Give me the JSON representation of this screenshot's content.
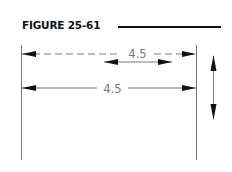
{
  "figure": {
    "title": "FIGURE 25-61",
    "dimensions": [
      {
        "id": "dashed-dimension",
        "label": "4.5",
        "style": "dashed"
      },
      {
        "id": "solid-dimension",
        "label": "4.5",
        "style": "solid"
      }
    ],
    "arrows": [
      {
        "id": "short-horizontal-double-arrow",
        "direction": "horizontal"
      },
      {
        "id": "vertical-double-arrow",
        "direction": "vertical"
      }
    ],
    "colors": {
      "line": "#555555",
      "arrowhead": "#111111",
      "text": "#777777",
      "title": "#111111"
    }
  }
}
